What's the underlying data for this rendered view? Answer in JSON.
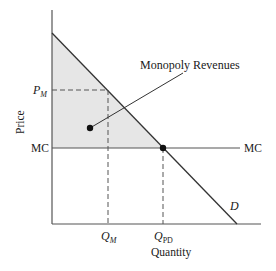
{
  "diagram": {
    "axes": {
      "y_label": "Price",
      "x_label": "Quantity"
    },
    "price_labels": {
      "pm": "P",
      "pm_sub": "M",
      "mc": "MC"
    },
    "quantity_labels": {
      "qm": "Q",
      "qm_sub": "M",
      "qpd": "Q",
      "qpd_sub": "PD"
    },
    "curves": {
      "mc_right_label": "MC",
      "demand_label": "D"
    },
    "annotation": {
      "label": "Monopoly Revenues"
    },
    "colors": {
      "shade": "#e6e6e6",
      "line": "#333333",
      "dash": "#555555",
      "text": "#1a1a1a"
    }
  }
}
